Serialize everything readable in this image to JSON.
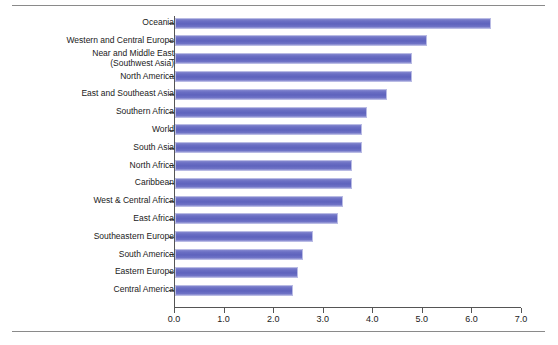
{
  "chart_data": {
    "type": "bar",
    "orientation": "horizontal",
    "title": "",
    "subtitle": "",
    "xlabel": "",
    "ylabel": "",
    "xlim": [
      0.0,
      7.0
    ],
    "grid": false,
    "legend": null,
    "xticks": [
      "0.0",
      "1.0",
      "2.0",
      "3.0",
      "4.0",
      "5.0",
      "6.0",
      "7.0"
    ],
    "xtick_values": [
      0.0,
      1.0,
      2.0,
      3.0,
      4.0,
      5.0,
      6.0,
      7.0
    ],
    "bar_color": "#6b6fc4",
    "categories": [
      "Oceania",
      "Western and Central Europe",
      "Near and Middle East\n(Southwest Asia)",
      "North America",
      "East and Southeast Asia",
      "Southern Africa",
      "World",
      "South Asia",
      "North Africa",
      "Caribbean",
      "West & Central Africa",
      "East Africa",
      "Southeastern Europe",
      "South America",
      "Eastern Europe",
      "Central America"
    ],
    "values": [
      6.4,
      5.1,
      4.8,
      4.8,
      4.3,
      3.9,
      3.8,
      3.8,
      3.6,
      3.6,
      3.4,
      3.3,
      2.8,
      2.6,
      2.5,
      2.4
    ]
  }
}
